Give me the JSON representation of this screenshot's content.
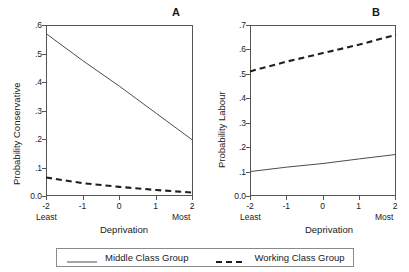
{
  "figure": {
    "panels": [
      {
        "letter": "A",
        "ylabel": "Probability Conservative",
        "xlabel": "Deprivation",
        "yticks": [
          "0.0",
          ".1",
          ".2",
          ".3",
          ".4",
          ".5",
          ".6"
        ],
        "xticks": [
          "-2",
          "-1",
          "0",
          "1",
          "2"
        ],
        "x_extreme_low": "Least",
        "x_extreme_high": "Most"
      },
      {
        "letter": "B",
        "ylabel": "Probability Labour",
        "xlabel": "Deprivation",
        "yticks": [
          "0.0",
          ".1",
          ".2",
          ".3",
          ".4",
          ".5",
          ".6",
          ".7"
        ],
        "xticks": [
          "-2",
          "-1",
          "0",
          "1",
          "2"
        ],
        "x_extreme_low": "Least",
        "x_extreme_high": "Most"
      }
    ]
  },
  "legend": {
    "entries": [
      {
        "label": "Middle Class Group",
        "style": "solid"
      },
      {
        "label": "Working Class Group",
        "style": "dashed"
      }
    ]
  },
  "colors": {
    "line": "#4d4d4d",
    "axis": "#555555",
    "text": "#1a1a1a",
    "background": "#ffffff"
  },
  "chart_data": [
    {
      "type": "line",
      "title": "A",
      "xlabel": "Deprivation",
      "ylabel": "Probability Conservative",
      "x": [
        -2,
        -1,
        0,
        1,
        2
      ],
      "xtick_labels": [
        "-2",
        "-1",
        "0",
        "1",
        "2"
      ],
      "xtick_extremes": {
        "low": "Least",
        "high": "Most"
      },
      "ytick_labels": [
        "0.0",
        ".1",
        ".2",
        ".3",
        ".4",
        ".5",
        ".6"
      ],
      "xlim": [
        -2,
        2
      ],
      "ylim": [
        0.0,
        0.6
      ],
      "grid": false,
      "legend_position": "below-figure",
      "series": [
        {
          "name": "Middle Class Group",
          "style": "solid",
          "values": [
            0.57,
            0.475,
            0.385,
            0.29,
            0.195
          ]
        },
        {
          "name": "Working Class Group",
          "style": "dashed",
          "values": [
            0.065,
            0.045,
            0.032,
            0.021,
            0.012
          ]
        }
      ]
    },
    {
      "type": "line",
      "title": "B",
      "xlabel": "Deprivation",
      "ylabel": "Probability Labour",
      "x": [
        -2,
        -1,
        0,
        1,
        2
      ],
      "xtick_labels": [
        "-2",
        "-1",
        "0",
        "1",
        "2"
      ],
      "xtick_extremes": {
        "low": "Least",
        "high": "Most"
      },
      "ytick_labels": [
        "0.0",
        ".1",
        ".2",
        ".3",
        ".4",
        ".5",
        ".6",
        ".7"
      ],
      "xlim": [
        -2,
        2
      ],
      "ylim": [
        0.0,
        0.7
      ],
      "grid": false,
      "legend_position": "below-figure",
      "series": [
        {
          "name": "Middle Class Group",
          "style": "solid",
          "values": [
            0.1,
            0.118,
            0.133,
            0.152,
            0.17
          ]
        },
        {
          "name": "Working Class Group",
          "style": "dashed",
          "values": [
            0.51,
            0.55,
            0.585,
            0.62,
            0.66
          ]
        }
      ]
    }
  ]
}
